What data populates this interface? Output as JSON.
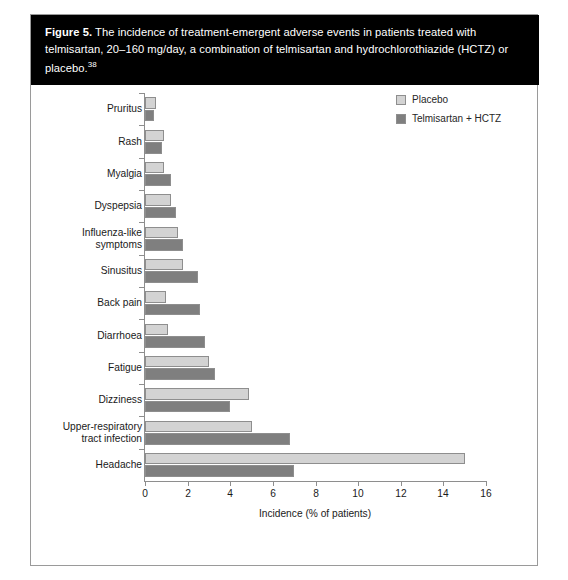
{
  "figure": {
    "label": "Figure 5.",
    "caption": "The incidence of treatment-emergent adverse events in patients treated with telmisartan, 20–160 mg/day, a combination of telmisartan and hydrochlorothiazide (HCTZ) or placebo.",
    "reference": "38"
  },
  "colors": {
    "placebo": "#d3d3d3",
    "telmisartan_hctz": "#7f7f7f",
    "bar_outline": "#8e8e8e",
    "axis": "#8e8e8e",
    "caption_bg": "#000000",
    "caption_fg": "#ffffff",
    "panel_border": "#9a9a9a"
  },
  "chart_data": {
    "type": "bar",
    "orientation": "horizontal",
    "title": "",
    "xlabel": "Incidence (% of patients)",
    "ylabel": "",
    "xlim": [
      0,
      16
    ],
    "xticks": [
      0,
      2,
      4,
      6,
      8,
      10,
      12,
      14,
      16
    ],
    "xtick_labels": [
      "0",
      "2",
      "4",
      "6",
      "8",
      "10",
      "12",
      "14",
      "16"
    ],
    "grid": false,
    "legend_position": "top-right",
    "categories": [
      "Pruritus",
      "Rash",
      "Myalgia",
      "Dyspepsia",
      "Influenza-like symptoms",
      "Sinusitus",
      "Back pain",
      "Diarrhoea",
      "Fatigue",
      "Dizziness",
      "Upper-respiratory tract infection",
      "Headache"
    ],
    "category_labels": [
      [
        "Pruritus"
      ],
      [
        "Rash"
      ],
      [
        "Myalgia"
      ],
      [
        "Dyspepsia"
      ],
      [
        "Influenza-like",
        "symptoms"
      ],
      [
        "Sinusitus"
      ],
      [
        "Back pain"
      ],
      [
        "Diarrhoea"
      ],
      [
        "Fatigue"
      ],
      [
        "Dizziness"
      ],
      [
        "Upper-respiratory",
        "tract infection"
      ],
      [
        "Headache"
      ]
    ],
    "series": [
      {
        "name": "Placebo",
        "color": "#d3d3d3",
        "values": [
          0.5,
          0.9,
          0.9,
          1.2,
          1.55,
          1.8,
          1.0,
          1.1,
          3.0,
          4.9,
          5.0,
          15.0
        ]
      },
      {
        "name": "Telmisartan + HCTZ",
        "color": "#7f7f7f",
        "values": [
          0.4,
          0.8,
          1.2,
          1.45,
          1.8,
          2.5,
          2.6,
          2.8,
          3.3,
          4.0,
          6.8,
          7.0
        ]
      }
    ]
  }
}
